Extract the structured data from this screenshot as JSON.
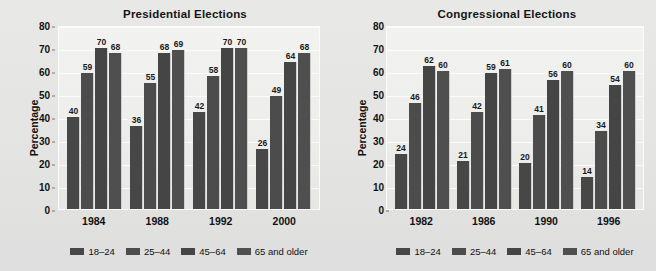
{
  "chart_data": [
    {
      "type": "bar",
      "title": "Presidential Elections",
      "xlabel": "",
      "ylabel": "Percentage",
      "ylim": [
        0,
        80
      ],
      "yticks": [
        80,
        70,
        60,
        50,
        40,
        30,
        20,
        10,
        0
      ],
      "grid": true,
      "legend_position": "bottom",
      "categories": [
        "1984",
        "1988",
        "1992",
        "2000"
      ],
      "series": [
        {
          "name": "18–24",
          "values": [
            40,
            36,
            42,
            26
          ]
        },
        {
          "name": "25–44",
          "values": [
            59,
            55,
            58,
            49
          ]
        },
        {
          "name": "45–64",
          "values": [
            70,
            68,
            70,
            64
          ]
        },
        {
          "name": "65 and older",
          "values": [
            68,
            69,
            70,
            68
          ]
        }
      ]
    },
    {
      "type": "bar",
      "title": "Congressional Elections",
      "xlabel": "",
      "ylabel": "Percentage",
      "ylim": [
        0,
        80
      ],
      "yticks": [
        80,
        70,
        60,
        50,
        40,
        30,
        20,
        10,
        0
      ],
      "grid": true,
      "legend_position": "bottom",
      "categories": [
        "1982",
        "1986",
        "1990",
        "1996"
      ],
      "series": [
        {
          "name": "18–24",
          "values": [
            24,
            21,
            20,
            14
          ]
        },
        {
          "name": "25–44",
          "values": [
            46,
            42,
            41,
            34
          ]
        },
        {
          "name": "45–64",
          "values": [
            62,
            59,
            56,
            54
          ]
        },
        {
          "name": "65 and older",
          "values": [
            60,
            61,
            60,
            60
          ]
        }
      ]
    }
  ],
  "colors": {
    "bar_series_1": "#474747",
    "bar_series_2": "#4c4c4c",
    "bar_series_3": "#454545",
    "bar_series_4": "#4f4f4f",
    "canvas_background": "#e6e6e4",
    "plot_background": "#eeeeec",
    "text": "#111111"
  }
}
